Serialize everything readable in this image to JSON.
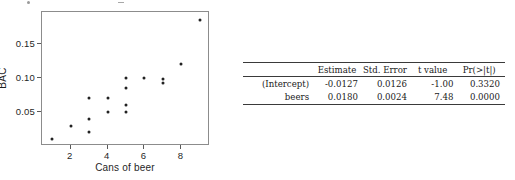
{
  "chart_data": {
    "type": "scatter",
    "title": "",
    "xlabel": "Cans of beer",
    "ylabel": "BAC",
    "xlim": [
      0.45,
      9.55
    ],
    "ylim": [
      0.0,
      0.197
    ],
    "xticks": [
      "2",
      "4",
      "6",
      "8"
    ],
    "xtick_values": [
      2,
      4,
      6,
      8
    ],
    "yticks": [
      "0.05",
      "0.10",
      "0.15"
    ],
    "ytick_values": [
      0.05,
      0.1,
      0.15
    ],
    "grid": false,
    "legend": "none",
    "marker": "filled-circle",
    "marker_color": "#222222",
    "n_points": 16,
    "x": [
      1,
      2,
      3,
      3,
      3,
      4,
      4,
      5,
      5,
      5,
      5,
      6,
      7,
      7,
      8,
      9
    ],
    "y": [
      0.01,
      0.03,
      0.07,
      0.04,
      0.02,
      0.07,
      0.05,
      0.1,
      0.085,
      0.06,
      0.05,
      0.1,
      0.098,
      0.092,
      0.12,
      0.185
    ],
    "points": [
      {
        "x": 1,
        "y": 0.01
      },
      {
        "x": 2,
        "y": 0.03
      },
      {
        "x": 3,
        "y": 0.07
      },
      {
        "x": 3,
        "y": 0.04
      },
      {
        "x": 3,
        "y": 0.02
      },
      {
        "x": 4,
        "y": 0.07
      },
      {
        "x": 4,
        "y": 0.05
      },
      {
        "x": 5,
        "y": 0.1
      },
      {
        "x": 5,
        "y": 0.085
      },
      {
        "x": 5,
        "y": 0.06
      },
      {
        "x": 5,
        "y": 0.05
      },
      {
        "x": 6,
        "y": 0.1
      },
      {
        "x": 7,
        "y": 0.098
      },
      {
        "x": 7,
        "y": 0.092
      },
      {
        "x": 8,
        "y": 0.12
      },
      {
        "x": 9,
        "y": 0.185
      }
    ]
  },
  "regression_table": {
    "columns": [
      "",
      "Estimate",
      "Std. Error",
      "t value",
      "Pr(>|t|)"
    ],
    "rows": [
      {
        "term": "(Intercept)",
        "estimate": "-0.0127",
        "std_error": "0.0126",
        "t_value": "-1.00",
        "p_value": "0.3320"
      },
      {
        "term": "beers",
        "estimate": "0.0180",
        "std_error": "0.0024",
        "t_value": "7.48",
        "p_value": "0.0000"
      }
    ]
  }
}
